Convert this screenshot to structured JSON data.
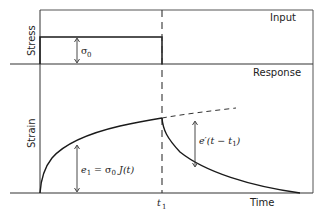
{
  "panels": {
    "input_title": "Input",
    "response_title": "Response"
  },
  "axes": {
    "stress_label": "Stress",
    "strain_label": "Strain",
    "time_label": "Time",
    "t1_label": "t",
    "t1_sub": "1"
  },
  "annotations": {
    "sigma0_main": "σ",
    "sigma0_sub": "0",
    "e1_eq": "e",
    "e1_sub": "1",
    "e1_rhs": " = σ",
    "e1_rhs_sub": "0",
    "e1_rhs_tail": " J(t)",
    "recovery": "e′(t − t",
    "recovery_sub": "1",
    "recovery_tail": ")"
  },
  "colors": {
    "line": "#1a1a1a",
    "border": "#555555"
  }
}
